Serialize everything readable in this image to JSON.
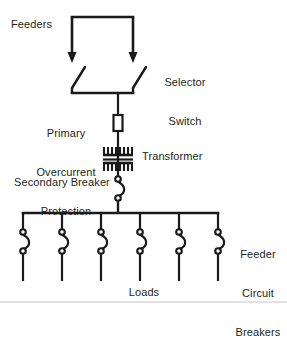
{
  "diagram": {
    "background_color": "#ffffff",
    "line_color": "#1a1a1a",
    "text_color": "#231f20",
    "labels": {
      "feeders": "Feeders",
      "selector_switch_line1": "Selector",
      "selector_switch_line2": "Switch",
      "primary_line1": "Primary",
      "primary_line2": "Overcurrent",
      "primary_line3": "Protection",
      "transformer": "Transformer",
      "secondary_breaker": "Secondary Breaker",
      "feeder_cb_line1": "Feeder",
      "feeder_cb_line2": "Circuit",
      "feeder_cb_line3": "Breakers",
      "loads": "Loads"
    },
    "components": {
      "incoming_bus": {
        "name": "feeder-bus",
        "y": 17,
        "x_start": 72,
        "x_end": 133
      },
      "selector_switch": {
        "name": "selector-switch",
        "pole_count": 2,
        "pole_x": [
          72,
          133
        ],
        "arrow_tip_y": 62,
        "blade_bottom_y": 93,
        "common_bar_y": 93
      },
      "primary_fuse": {
        "name": "primary-overcurrent-fuse",
        "x": 118,
        "y_top": 115,
        "y_bottom": 131,
        "width": 9
      },
      "transformer": {
        "name": "transformer",
        "x_center": 118,
        "y_top": 146,
        "y_bottom": 168,
        "teeth": 6
      },
      "secondary_breaker": {
        "name": "secondary-breaker",
        "x": 118,
        "y_top": 176,
        "y_bottom": 199
      },
      "secondary_bus": {
        "name": "secondary-bus",
        "y": 213,
        "x_start": 23,
        "x_end": 218
      },
      "feeder_breakers": {
        "name": "feeder-circuit-breakers",
        "count": 6,
        "x_positions": [
          23,
          62,
          101,
          140,
          179,
          218
        ],
        "y_top": 230,
        "y_bottom": 252,
        "load_line_bottom": 281
      },
      "bottom_divider": {
        "name": "bottom-divider",
        "y": 302
      }
    }
  }
}
